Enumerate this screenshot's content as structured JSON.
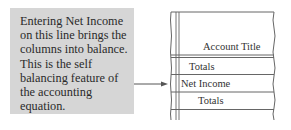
{
  "callout": {
    "lines": [
      "Entering Net Income",
      "on this line brings the",
      "columns into balance.",
      "This is the self",
      "balancing feature of",
      "the accounting",
      "equation."
    ]
  },
  "ledger": {
    "header": "Account Title",
    "rows": [
      "Totals",
      "Net Income",
      "Totals"
    ]
  },
  "colors": {
    "callout_bg": "#d6d6d6",
    "line": "#555555"
  }
}
